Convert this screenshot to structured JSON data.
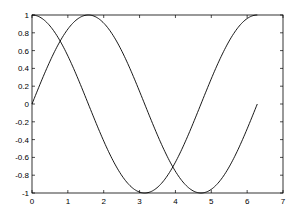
{
  "chart_data": {
    "type": "line",
    "title": "",
    "xlabel": "",
    "ylabel": "",
    "xlim": [
      0,
      7
    ],
    "ylim": [
      -1,
      1
    ],
    "grid": false,
    "legend": null,
    "x_ticks": [
      0,
      1,
      2,
      3,
      4,
      5,
      6,
      7
    ],
    "x_tick_labels": [
      "0",
      "1",
      "2",
      "3",
      "4",
      "5",
      "6",
      "7"
    ],
    "y_ticks": [
      -1,
      -0.8,
      -0.6,
      -0.4,
      -0.2,
      0,
      0.2,
      0.4,
      0.6,
      0.8,
      1
    ],
    "y_tick_labels": [
      "-1",
      "-0.8",
      "-0.6",
      "-0.4",
      "-0.2",
      "0",
      "0.2",
      "0.4",
      "0.6",
      "0.8",
      "1"
    ],
    "series": [
      {
        "name": "sin(x)",
        "function": "sin",
        "x_range": [
          0,
          6.2832
        ],
        "color": "#000000",
        "x": [
          0,
          0.5,
          1.0,
          1.5708,
          2.0,
          2.5,
          3.1416,
          3.5,
          4.0,
          4.7124,
          5.0,
          5.5,
          6.2832
        ],
        "values": [
          0,
          0.479,
          0.841,
          1.0,
          0.909,
          0.598,
          0,
          -0.351,
          -0.757,
          -1.0,
          -0.959,
          -0.706,
          0
        ]
      },
      {
        "name": "cos(x)",
        "function": "cos",
        "x_range": [
          0,
          6.2832
        ],
        "color": "#000000",
        "x": [
          0,
          0.5,
          1.0,
          1.5708,
          2.0,
          2.5,
          3.1416,
          3.5,
          4.0,
          4.7124,
          5.0,
          5.5,
          6.2832
        ],
        "values": [
          1.0,
          0.878,
          0.54,
          0,
          -0.416,
          -0.801,
          -1.0,
          -0.936,
          -0.654,
          0,
          0.284,
          0.709,
          1.0
        ]
      }
    ]
  }
}
